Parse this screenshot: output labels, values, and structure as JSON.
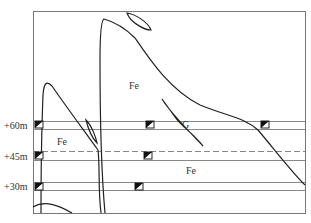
{
  "levels": [
    {
      "label": "+60m",
      "y": 125
    },
    {
      "label": "+45m",
      "y": 156
    },
    {
      "label": "+30m",
      "y": 186
    }
  ],
  "zones": [
    {
      "label": "Fe",
      "x": 129,
      "y": 81
    },
    {
      "label": "Fe",
      "x": 56,
      "y": 136
    },
    {
      "label": "G",
      "x": 182,
      "y": 120
    },
    {
      "label": "Fe",
      "x": 188,
      "y": 166
    }
  ],
  "colors": {
    "line": "#222222",
    "frame": "#777777",
    "level_line": "#888888"
  }
}
